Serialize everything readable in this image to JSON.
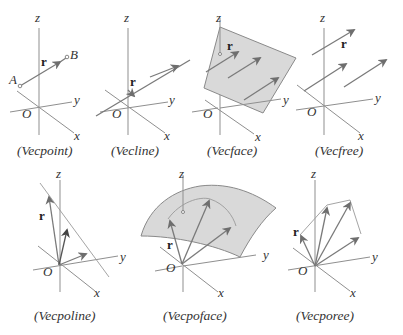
{
  "figure": {
    "panels": [
      {
        "id": "vecpoint",
        "caption": "(Vecpoint)",
        "labels": {
          "z": "z",
          "y": "y",
          "x": "x",
          "origin": "O",
          "vector": "r",
          "start": "A",
          "end": "B"
        }
      },
      {
        "id": "vecline",
        "caption": "(Vecline)",
        "labels": {
          "z": "z",
          "y": "y",
          "x": "x",
          "origin": "O",
          "vector": "r"
        }
      },
      {
        "id": "vecface",
        "caption": "(Vecface)",
        "labels": {
          "z": "z",
          "y": "y",
          "x": "x",
          "origin": "O",
          "vector": "r"
        }
      },
      {
        "id": "vecfree",
        "caption": "(Vecfree)",
        "labels": {
          "z": "z",
          "y": "y",
          "x": "x",
          "origin": "O",
          "vector": "r"
        }
      },
      {
        "id": "vecpoline",
        "caption": "(Vecpoline)",
        "labels": {
          "z": "z",
          "y": "y",
          "x": "x",
          "origin": "O",
          "vector": "r"
        }
      },
      {
        "id": "vecpoface",
        "caption": "(Vecpoface)",
        "labels": {
          "z": "z",
          "y": "y",
          "x": "x",
          "origin": "O",
          "vector": "r"
        }
      },
      {
        "id": "vecporee",
        "caption": "(Vecporee)",
        "labels": {
          "z": "z",
          "y": "y",
          "x": "x",
          "origin": "O",
          "vector": "r"
        }
      }
    ],
    "colors": {
      "axis": "#8f8f8f",
      "vector": "#7a7a7a",
      "surface": "#d9d9d9",
      "text": "#333333"
    }
  }
}
